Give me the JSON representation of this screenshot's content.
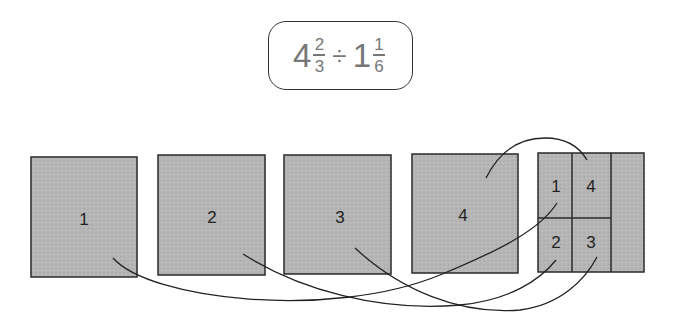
{
  "expression": {
    "whole1": "4",
    "num1": "2",
    "den1": "3",
    "operator": "÷",
    "whole2": "1",
    "num2": "1",
    "den2": "6"
  },
  "colors": {
    "box_fill": "#b4b4b4",
    "stroke": "#2a2a2a",
    "expr_text": "#777777"
  },
  "wholes": [
    {
      "label": "1"
    },
    {
      "label": "2"
    },
    {
      "label": "3"
    },
    {
      "label": "4"
    }
  ],
  "divisor_model": {
    "cells": [
      {
        "label": "1"
      },
      {
        "label": "4"
      },
      {
        "label": "2"
      },
      {
        "label": "3"
      }
    ]
  },
  "connections": [
    {
      "from": "1",
      "to": "1"
    },
    {
      "from": "2",
      "to": "2"
    },
    {
      "from": "3",
      "to": "3"
    },
    {
      "from": "4",
      "to": "4"
    }
  ]
}
